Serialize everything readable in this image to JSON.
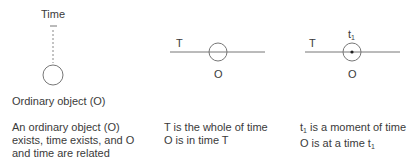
{
  "panels": [
    {
      "id": "ordinary-object",
      "top_label": "Time",
      "object_label": "Ordinary object (O)",
      "caption": [
        "An ordinary object (O)",
        "exists, time exists, and O",
        "and time are related"
      ]
    },
    {
      "id": "whole-of-time",
      "line_label": "T",
      "object_label": "O",
      "caption": [
        "T is the whole of time",
        "O is in time T"
      ]
    },
    {
      "id": "moment-of-time",
      "line_label": "T",
      "point_label_base": "t",
      "point_label_sub": "1",
      "object_label": "O",
      "caption_line1_base": "t",
      "caption_line1_sub": "1",
      "caption_line1_rest": " is a moment of time",
      "caption_line2_pre": "O is at a time t",
      "caption_line2_sub": "1"
    }
  ]
}
